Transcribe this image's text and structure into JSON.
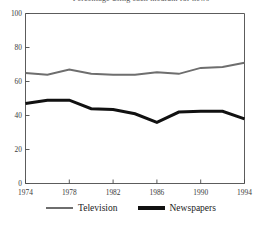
{
  "figure": {
    "clipped_title": "Percentage using each medium for news"
  },
  "legend": {
    "position": "bottom-center",
    "entries": [
      {
        "label": "Television",
        "color": "#6e6e6e",
        "thickness": 2.0
      },
      {
        "label": "Newspapers",
        "color": "#111111",
        "thickness": 3.0
      }
    ]
  },
  "chart_data": {
    "type": "line",
    "title": "",
    "xlabel": "",
    "ylabel": "",
    "xlim": [
      1974,
      1994
    ],
    "ylim": [
      0,
      100
    ],
    "grid": false,
    "legend_position": "bottom-center",
    "x": [
      1974,
      1976,
      1978,
      1980,
      1982,
      1984,
      1986,
      1988,
      1990,
      1992,
      1994
    ],
    "xtick_labels": [
      "1974",
      "1978",
      "1982",
      "1986",
      "1990",
      "1994"
    ],
    "xtick_values": [
      1974,
      1978,
      1982,
      1986,
      1990,
      1994
    ],
    "ytick_labels": [
      "0",
      "20",
      "40",
      "60",
      "80",
      "100"
    ],
    "ytick_values": [
      0,
      20,
      40,
      60,
      80,
      100
    ],
    "series": [
      {
        "name": "Television",
        "color": "#6e6e6e",
        "values": [
          65,
          64,
          67,
          64.5,
          64,
          64,
          65.5,
          64.5,
          68,
          68.5,
          71
        ]
      },
      {
        "name": "Newspapers",
        "color": "#111111",
        "values": [
          47,
          49,
          49,
          44,
          43.5,
          41,
          36,
          42,
          42.5,
          42.5,
          38
        ]
      }
    ]
  }
}
